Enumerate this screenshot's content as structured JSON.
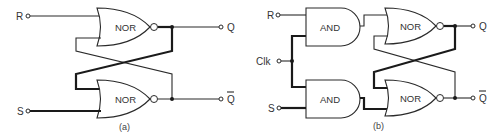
{
  "diagram_a": {
    "caption": "(a)",
    "inputs": {
      "top": "R",
      "bottom": "S"
    },
    "outputs": {
      "top": "Q",
      "bottom": "Q"
    },
    "gates": [
      {
        "type": "NOR",
        "label": "NOR"
      },
      {
        "type": "NOR",
        "label": "NOR"
      }
    ]
  },
  "diagram_b": {
    "caption": "(b)",
    "inputs": {
      "top": "R",
      "clock": "Clk",
      "bottom": "S"
    },
    "outputs": {
      "top": "Q",
      "bottom": "Q"
    },
    "and_gates": [
      {
        "type": "AND",
        "label": "AND"
      },
      {
        "type": "AND",
        "label": "AND"
      }
    ],
    "nor_gates": [
      {
        "type": "NOR",
        "label": "NOR"
      },
      {
        "type": "NOR",
        "label": "NOR"
      }
    ]
  },
  "colors": {
    "line": "#2a2a2a",
    "background": "#ffffff"
  }
}
